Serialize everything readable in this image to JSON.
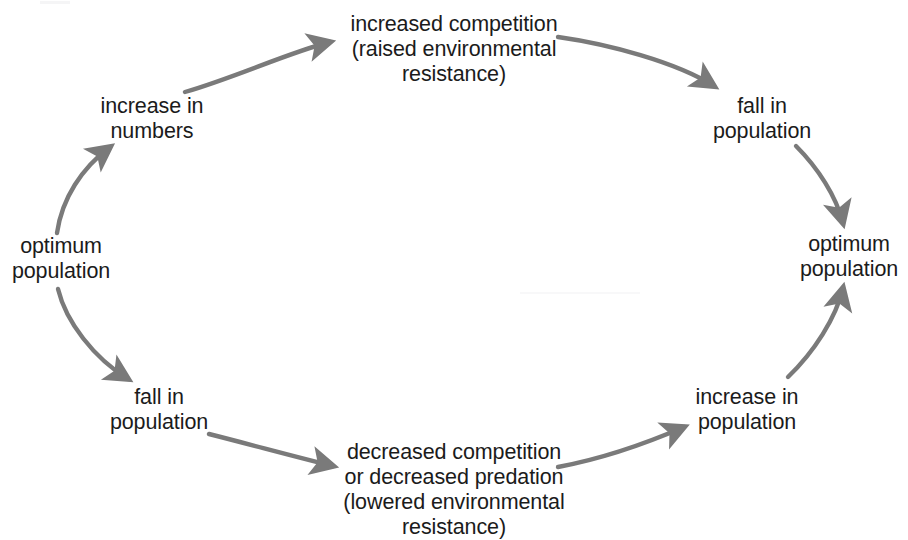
{
  "diagram": {
    "type": "cycle-flow-diagram",
    "background_color": "#ffffff",
    "text_color": "#1b1b1b",
    "arrow_color": "#7a7a7a",
    "nodes": [
      {
        "id": "increased-competition",
        "text": "increased competition\n(raised environmental\nresistance)",
        "position": "top-center"
      },
      {
        "id": "increase-in-numbers",
        "text": "increase in\nnumbers",
        "position": "upper-left"
      },
      {
        "id": "fall-in-population-top",
        "text": "fall in\npopulation",
        "position": "upper-right"
      },
      {
        "id": "optimum-population-left",
        "text": "optimum\npopulation",
        "position": "left"
      },
      {
        "id": "optimum-population-right",
        "text": "optimum\npopulation",
        "position": "right"
      },
      {
        "id": "fall-in-population-bottom",
        "text": "fall in\npopulation",
        "position": "lower-left"
      },
      {
        "id": "increase-in-population",
        "text": "increase in\npopulation",
        "position": "lower-right"
      },
      {
        "id": "decreased-competition",
        "text": "decreased competition\nor decreased predation\n(lowered environmental\nresistance)",
        "position": "bottom-center"
      }
    ],
    "edges": [
      {
        "id": "edge-optimum-left-to-increase-numbers",
        "from": "optimum-population-left",
        "to": "increase-in-numbers",
        "direction": "up-right"
      },
      {
        "id": "edge-increase-numbers-to-increased-competition",
        "from": "increase-in-numbers",
        "to": "increased-competition",
        "direction": "right-up"
      },
      {
        "id": "edge-increased-competition-to-fall-top",
        "from": "increased-competition",
        "to": "fall-in-population-top",
        "direction": "right-down"
      },
      {
        "id": "edge-fall-top-to-optimum-right",
        "from": "fall-in-population-top",
        "to": "optimum-population-right",
        "direction": "down-right"
      },
      {
        "id": "edge-optimum-left-to-fall-bottom",
        "from": "optimum-population-left",
        "to": "fall-in-population-bottom",
        "direction": "down-right"
      },
      {
        "id": "edge-fall-bottom-to-decreased-competition",
        "from": "fall-in-population-bottom",
        "to": "decreased-competition",
        "direction": "right-down"
      },
      {
        "id": "edge-decreased-competition-to-increase-pop",
        "from": "decreased-competition",
        "to": "increase-in-population",
        "direction": "right-up"
      },
      {
        "id": "edge-increase-pop-to-optimum-right",
        "from": "increase-in-population",
        "to": "optimum-population-right",
        "direction": "up-right"
      }
    ]
  }
}
